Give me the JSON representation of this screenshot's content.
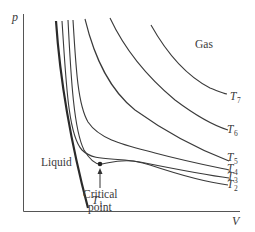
{
  "diagram": {
    "axes": {
      "y_label": "p",
      "x_label": "V"
    },
    "regions": {
      "gas": "Gas",
      "liquid": "Liquid"
    },
    "critical_point": {
      "line1": "Critical",
      "line2": "point"
    },
    "isotherms": [
      {
        "name": "T",
        "sub": "1"
      },
      {
        "name": "T",
        "sub": "2"
      },
      {
        "name": "T",
        "sub": "3"
      },
      {
        "name": "T",
        "sub": "4"
      },
      {
        "name": "T",
        "sub": "5"
      },
      {
        "name": "T",
        "sub": "6"
      },
      {
        "name": "T",
        "sub": "7"
      }
    ],
    "colors": {
      "line": "#3a3a3a",
      "axis": "#555555",
      "background": "#ffffff"
    }
  }
}
